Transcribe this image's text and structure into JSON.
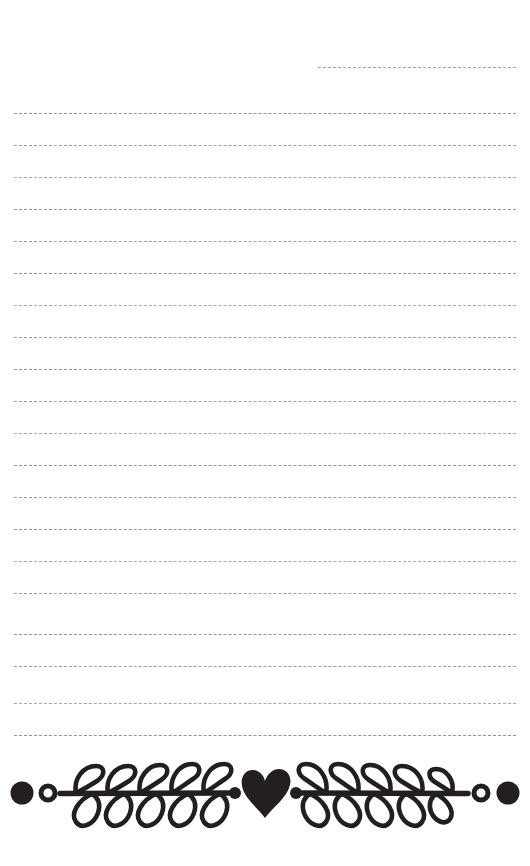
{
  "page": {
    "kind": "lined-notepaper-sheet",
    "width_px": 530,
    "height_px": 866,
    "background_color": "#ffffff",
    "ink_color": "#231f20",
    "rule_color": "#9a9a9a"
  },
  "rules": {
    "count": 21,
    "style": "dashed",
    "dash_length_px": 7,
    "dash_gap_px": 5,
    "thickness_px": 1.6,
    "full_left_x": 14,
    "full_right_x": 516,
    "first_line_is_partial": true,
    "first_line_left_x": 318,
    "spacing_px": 32,
    "lines": [
      {
        "index": 1,
        "y": 67,
        "left_x": 318,
        "right_x": 516,
        "partial": true,
        "variant": "v1"
      },
      {
        "index": 2,
        "y": 113,
        "left_x": 14,
        "right_x": 516,
        "partial": false,
        "variant": "v2"
      },
      {
        "index": 3,
        "y": 145,
        "left_x": 14,
        "right_x": 516,
        "partial": false,
        "variant": "v1"
      },
      {
        "index": 4,
        "y": 177,
        "left_x": 14,
        "right_x": 516,
        "partial": false,
        "variant": "v3"
      },
      {
        "index": 5,
        "y": 209,
        "left_x": 14,
        "right_x": 516,
        "partial": false,
        "variant": "v2"
      },
      {
        "index": 6,
        "y": 241,
        "left_x": 14,
        "right_x": 516,
        "partial": false,
        "variant": "v1"
      },
      {
        "index": 7,
        "y": 273,
        "left_x": 14,
        "right_x": 516,
        "partial": false,
        "variant": "v2"
      },
      {
        "index": 8,
        "y": 305,
        "left_x": 14,
        "right_x": 516,
        "partial": false,
        "variant": "v3"
      },
      {
        "index": 9,
        "y": 337,
        "left_x": 14,
        "right_x": 516,
        "partial": false,
        "variant": "v1"
      },
      {
        "index": 10,
        "y": 369,
        "left_x": 14,
        "right_x": 516,
        "partial": false,
        "variant": "v2"
      },
      {
        "index": 11,
        "y": 401,
        "left_x": 14,
        "right_x": 516,
        "partial": false,
        "variant": "v1"
      },
      {
        "index": 12,
        "y": 433,
        "left_x": 14,
        "right_x": 516,
        "partial": false,
        "variant": "v3"
      },
      {
        "index": 13,
        "y": 465,
        "left_x": 14,
        "right_x": 516,
        "partial": false,
        "variant": "v2"
      },
      {
        "index": 14,
        "y": 497,
        "left_x": 14,
        "right_x": 516,
        "partial": false,
        "variant": "v1"
      },
      {
        "index": 15,
        "y": 529,
        "left_x": 14,
        "right_x": 516,
        "partial": false,
        "variant": "v2"
      },
      {
        "index": 16,
        "y": 561,
        "left_x": 14,
        "right_x": 516,
        "partial": false,
        "variant": "v3"
      },
      {
        "index": 17,
        "y": 593,
        "left_x": 14,
        "right_x": 516,
        "partial": false,
        "variant": "v1"
      },
      {
        "index": 18,
        "y": 634,
        "left_x": 14,
        "right_x": 516,
        "partial": false,
        "variant": "v2"
      },
      {
        "index": 19,
        "y": 666,
        "left_x": 14,
        "right_x": 516,
        "partial": false,
        "variant": "v1"
      },
      {
        "index": 20,
        "y": 703,
        "left_x": 14,
        "right_x": 516,
        "partial": false,
        "variant": "v3"
      },
      {
        "index": 21,
        "y": 735,
        "left_x": 14,
        "right_x": 516,
        "partial": false,
        "variant": "v2"
      }
    ]
  },
  "divider": {
    "name": "laurel-heart-divider",
    "top_y": 752,
    "height_px": 86,
    "stem_center_y": 41,
    "color": "#231f20",
    "elements": [
      {
        "type": "filled-dot",
        "cx": 22,
        "r": 11
      },
      {
        "type": "hollow-dot",
        "cx": 48,
        "r": 8,
        "stroke_width": 5
      },
      {
        "type": "branch-right",
        "x_start": 60,
        "x_end": 228,
        "leaf_pairs": 5
      },
      {
        "type": "small-dot",
        "cx": 234,
        "r": 6
      },
      {
        "type": "heart",
        "cx": 265,
        "cy": 40,
        "width": 44,
        "height": 52
      },
      {
        "type": "small-dot",
        "cx": 295,
        "r": 6
      },
      {
        "type": "branch-left",
        "x_start": 302,
        "x_end": 470,
        "leaf_pairs": 5
      },
      {
        "type": "hollow-dot",
        "cx": 481,
        "r": 8,
        "stroke_width": 5
      },
      {
        "type": "filled-dot",
        "cx": 508,
        "r": 11
      }
    ]
  }
}
